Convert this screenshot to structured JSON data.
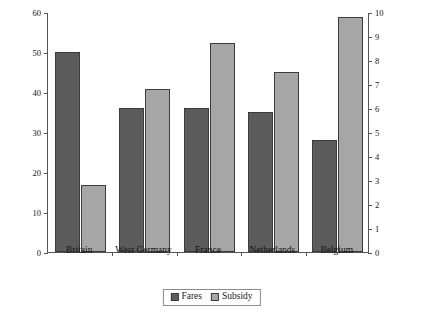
{
  "chart_data": {
    "type": "bar",
    "title": "",
    "categories": [
      "Britain",
      "West Germany",
      "France",
      "Netherlands",
      "Belgium"
    ],
    "series": [
      {
        "name": "Fares",
        "axis": "left",
        "values": [
          50,
          36,
          36,
          35,
          28
        ]
      },
      {
        "name": "Subsidy",
        "axis": "right",
        "values": [
          2.8,
          6.8,
          8.7,
          7.5,
          9.8
        ]
      }
    ],
    "left_axis": {
      "label": "Fares pence operating per mile costs",
      "ticks": [
        0,
        10,
        20,
        30,
        40,
        50,
        60
      ],
      "lim": [
        0,
        60
      ]
    },
    "right_axis": {
      "label": "Subsidy pence operating per mile costs",
      "ticks": [
        0,
        1,
        2,
        3,
        4,
        5,
        6,
        7,
        8,
        9,
        10
      ],
      "lim": [
        0,
        10
      ]
    },
    "xlabel": "",
    "grid": false,
    "legend_position": "bottom-center"
  },
  "legend": {
    "items": [
      {
        "label": "Fares",
        "color": "#5c5c5c"
      },
      {
        "label": "Subsidy",
        "color": "#a6a6a6"
      }
    ]
  },
  "colors": {
    "fares": "#5c5c5c",
    "subsidy": "#a6a6a6",
    "axis": "#555555",
    "text": "#141414",
    "background": "#ffffff"
  }
}
